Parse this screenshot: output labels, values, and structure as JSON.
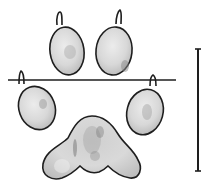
{
  "figure": {
    "caption": "",
    "colors": {
      "background": "#ffffff",
      "outline": "#1e1e1e",
      "pad_fill": "#d6d6d6",
      "pad_highlight": "#ececec",
      "pad_shadow": "#9a9a9a"
    },
    "elements": {
      "toe_pads": [
        {
          "id": "toe-top-left",
          "claw": true
        },
        {
          "id": "toe-top-right",
          "claw": true
        },
        {
          "id": "toe-outer-left",
          "claw": true
        },
        {
          "id": "toe-outer-right",
          "claw": true
        }
      ],
      "heel_pad": {
        "shape": "trilobed"
      },
      "reference_line": {
        "orientation": "horizontal"
      },
      "scale_bar": {
        "orientation": "vertical",
        "label": ""
      }
    }
  }
}
